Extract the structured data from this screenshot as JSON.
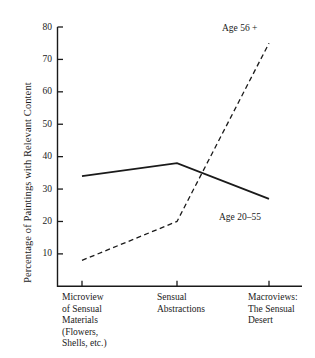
{
  "chart_data": {
    "type": "line",
    "title": "",
    "xlabel": "",
    "ylabel": "Percentage of Paintings with Relevant Content",
    "ylim": [
      0,
      80
    ],
    "yticks": [
      10,
      20,
      30,
      40,
      50,
      60,
      70,
      80
    ],
    "ytick_labels": [
      "10",
      "20",
      "30",
      "40",
      "50",
      "60",
      "70",
      "80"
    ],
    "grid": false,
    "legend_position": "inline-at-line-end",
    "categories": [
      "Microview\nof Sensual\nMaterials\n(Flowers,\nShells, etc.)",
      "Sensual\nAbstractions",
      "Macroviews:\nThe Sensual\nDesert"
    ],
    "series": [
      {
        "name": "Age 20–55",
        "style": "solid",
        "color": "#1a1a1a",
        "values": [
          34,
          38,
          27
        ]
      },
      {
        "name": "Age 56 +",
        "style": "dashed",
        "color": "#1a1a1a",
        "values": [
          8,
          20,
          75
        ]
      }
    ],
    "annotations": [
      {
        "text": "Age 56 +",
        "series": "Age 56 +"
      },
      {
        "text": "Age 20–55",
        "series": "Age 20–55"
      }
    ]
  },
  "axis": {
    "color": "#1a1a1a"
  }
}
